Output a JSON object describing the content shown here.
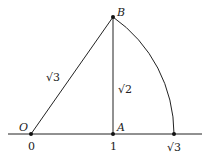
{
  "diagram": {
    "points": {
      "O": {
        "label": "O",
        "tick": "0"
      },
      "A": {
        "label": "A",
        "tick": "1"
      },
      "B": {
        "label": "B"
      },
      "C": {
        "tick": "√3"
      }
    },
    "segments": {
      "OB": "√3",
      "AB": "√2"
    },
    "colors": {
      "line": "#222222",
      "background": "#ffffff"
    }
  }
}
